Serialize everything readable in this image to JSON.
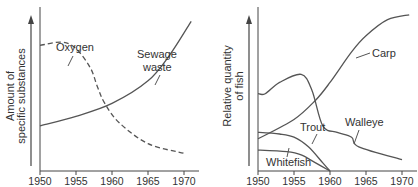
{
  "chart_data": [
    {
      "type": "line",
      "title": "",
      "xlabel": "",
      "ylabel": "Amount of specific substances",
      "ylabel_lines": [
        "Amount of",
        "specific substances"
      ],
      "x_ticks": [
        "1950",
        "1955",
        "1960",
        "1965",
        "1970"
      ],
      "xlim": [
        1950,
        1971
      ],
      "grid": false,
      "series": [
        {
          "name": "Oxygen",
          "style": "dashed",
          "x": [
            1950,
            1953,
            1955,
            1957,
            1958,
            1959,
            1961,
            1965,
            1970
          ],
          "values": [
            0.78,
            0.8,
            0.76,
            0.64,
            0.52,
            0.42,
            0.3,
            0.17,
            0.11
          ]
        },
        {
          "name": "Sewage waste",
          "style": "solid",
          "label_lines": [
            "Sewage",
            "waste"
          ],
          "x": [
            1950,
            1955,
            1960,
            1965,
            1968,
            1971
          ],
          "values": [
            0.28,
            0.34,
            0.42,
            0.56,
            0.72,
            0.93
          ]
        }
      ]
    },
    {
      "type": "line",
      "title": "",
      "xlabel": "",
      "ylabel": "Relative quantity of fish",
      "ylabel_lines": [
        "Relative quantity",
        "of fish"
      ],
      "x_ticks": [
        "1950",
        "1955",
        "1960",
        "1965",
        "1970"
      ],
      "xlim": [
        1950,
        1971
      ],
      "grid": false,
      "series": [
        {
          "name": "Carp",
          "style": "solid",
          "x": [
            1950,
            1955,
            1958,
            1960,
            1963,
            1965,
            1968,
            1971
          ],
          "values": [
            0.2,
            0.32,
            0.44,
            0.55,
            0.74,
            0.84,
            0.94,
            0.97
          ]
        },
        {
          "name": "Walleye",
          "style": "solid",
          "x": [
            1950,
            1951,
            1953,
            1956,
            1957.5,
            1959,
            1961,
            1963,
            1964,
            1970
          ],
          "values": [
            0.48,
            0.48,
            0.55,
            0.6,
            0.5,
            0.28,
            0.24,
            0.21,
            0.15,
            0.07
          ]
        },
        {
          "name": "Trout",
          "style": "solid",
          "x": [
            1950,
            1953,
            1955,
            1957,
            1959,
            1960
          ],
          "values": [
            0.24,
            0.23,
            0.21,
            0.15,
            0.05,
            0.0
          ]
        },
        {
          "name": "Whitefish",
          "style": "solid",
          "x": [
            1950,
            1954,
            1956,
            1958,
            1960
          ],
          "values": [
            0.13,
            0.12,
            0.1,
            0.05,
            0.0
          ]
        }
      ]
    }
  ]
}
